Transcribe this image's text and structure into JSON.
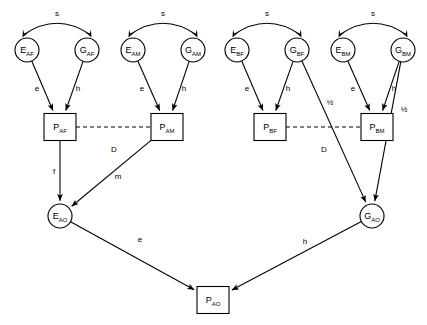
{
  "diagram": {
    "width": 427,
    "height": 325,
    "background_color": "#ffffff",
    "line_color": "#000000",
    "nodes": [
      {
        "id": "EAF",
        "base": "E",
        "sub": "AF",
        "shape": "circle",
        "cx": 27,
        "cy": 50,
        "r": 12
      },
      {
        "id": "GAF",
        "base": "G",
        "sub": "AF",
        "shape": "circle",
        "cx": 87,
        "cy": 50,
        "r": 12
      },
      {
        "id": "EAM",
        "base": "E",
        "sub": "AM",
        "shape": "circle",
        "cx": 133,
        "cy": 50,
        "r": 12
      },
      {
        "id": "GAM",
        "base": "G",
        "sub": "AM",
        "shape": "circle",
        "cx": 193,
        "cy": 50,
        "r": 12
      },
      {
        "id": "EBF",
        "base": "E",
        "sub": "BF",
        "shape": "circle",
        "cx": 237,
        "cy": 50,
        "r": 12
      },
      {
        "id": "GBF",
        "base": "G",
        "sub": "BF",
        "shape": "circle",
        "cx": 297,
        "cy": 50,
        "r": 12
      },
      {
        "id": "EBM",
        "base": "E",
        "sub": "BM",
        "shape": "circle",
        "cx": 343,
        "cy": 50,
        "r": 12
      },
      {
        "id": "GBM",
        "base": "G",
        "sub": "BM",
        "shape": "circle",
        "cx": 403,
        "cy": 50,
        "r": 12
      },
      {
        "id": "PAF",
        "base": "P",
        "sub": "AF",
        "shape": "rect",
        "cx": 60,
        "cy": 127,
        "w": 32,
        "h": 27
      },
      {
        "id": "PAM",
        "base": "P",
        "sub": "AM",
        "shape": "rect",
        "cx": 167,
        "cy": 127,
        "w": 32,
        "h": 27
      },
      {
        "id": "PBF",
        "base": "P",
        "sub": "BF",
        "shape": "rect",
        "cx": 270,
        "cy": 127,
        "w": 32,
        "h": 27
      },
      {
        "id": "PBM",
        "base": "P",
        "sub": "BM",
        "shape": "rect",
        "cx": 377,
        "cy": 127,
        "w": 32,
        "h": 27
      },
      {
        "id": "EAO",
        "base": "E",
        "sub": "AO",
        "shape": "circle",
        "cx": 60,
        "cy": 216,
        "r": 12
      },
      {
        "id": "GAO",
        "base": "G",
        "sub": "AO",
        "shape": "circle",
        "cx": 372,
        "cy": 216,
        "r": 12
      },
      {
        "id": "PAO",
        "base": "P",
        "sub": "AO",
        "shape": "rect",
        "cx": 213,
        "cy": 300,
        "w": 32,
        "h": 27
      }
    ],
    "correlation_arcs": [
      {
        "id": "s-A-F",
        "from": "EAF",
        "to": "GAF",
        "label": "s",
        "label_x": 57,
        "label_y": 14
      },
      {
        "id": "s-A-M",
        "from": "EAM",
        "to": "GAM",
        "label": "s",
        "label_x": 163,
        "label_y": 14
      },
      {
        "id": "s-B-F",
        "from": "EBF",
        "to": "GBF",
        "label": "s",
        "label_x": 267,
        "label_y": 14
      },
      {
        "id": "s-B-M",
        "from": "EBM",
        "to": "GBM",
        "label": "s",
        "label_x": 373,
        "label_y": 14
      }
    ],
    "edges": [
      {
        "id": "EAF-PAF",
        "from": "EAF",
        "to": "PAF",
        "label": "e",
        "label_x": 37,
        "label_y": 89
      },
      {
        "id": "GAF-PAF",
        "from": "GAF",
        "to": "PAF",
        "label": "h",
        "label_x": 78,
        "label_y": 89
      },
      {
        "id": "EAM-PAM",
        "from": "EAM",
        "to": "PAM",
        "label": "e",
        "label_x": 142,
        "label_y": 89
      },
      {
        "id": "GAM-PAM",
        "from": "GAM",
        "to": "PAM",
        "label": "h",
        "label_x": 184,
        "label_y": 89
      },
      {
        "id": "EBF-PBF",
        "from": "EBF",
        "to": "PBF",
        "label": "e",
        "label_x": 247,
        "label_y": 89
      },
      {
        "id": "GBF-PBF",
        "from": "GBF",
        "to": "PBF",
        "label": "h",
        "label_x": 288,
        "label_y": 89
      },
      {
        "id": "EBM-PBM",
        "from": "EBM",
        "to": "PBM",
        "label": "e",
        "label_x": 353,
        "label_y": 89
      },
      {
        "id": "GBM-PBM",
        "from": "GBM",
        "to": "PBM",
        "label": "h",
        "label_x": 394,
        "label_y": 89
      },
      {
        "id": "GBF-GAO",
        "from": "GBF",
        "to": "GAO",
        "label": "½",
        "label_x": 330,
        "label_y": 103
      },
      {
        "id": "GBM-GAO",
        "from": "GBM",
        "to": "GAO",
        "label": "½",
        "label_x": 404,
        "label_y": 110
      },
      {
        "id": "PAF-EAO",
        "from": "PAF",
        "to": "EAO",
        "label": "f",
        "label_x": 54,
        "label_y": 172
      },
      {
        "id": "PAM-EAO",
        "from": "PAM",
        "to": "EAO",
        "label": "m",
        "label_x": 118,
        "label_y": 177
      },
      {
        "id": "EAO-PAO",
        "from": "EAO",
        "to": "PAO",
        "label": "e",
        "label_x": 140,
        "label_y": 240
      },
      {
        "id": "GAO-PAO",
        "from": "GAO",
        "to": "PAO",
        "label": "h",
        "label_x": 305,
        "label_y": 242
      }
    ],
    "dashed_edges": [
      {
        "id": "D-A",
        "from": "PAF",
        "to": "PAM",
        "label": "D",
        "label_x": 114,
        "label_y": 150
      },
      {
        "id": "D-B",
        "from": "PBF",
        "to": "PBM",
        "label": "D",
        "label_x": 324,
        "label_y": 150
      }
    ]
  }
}
